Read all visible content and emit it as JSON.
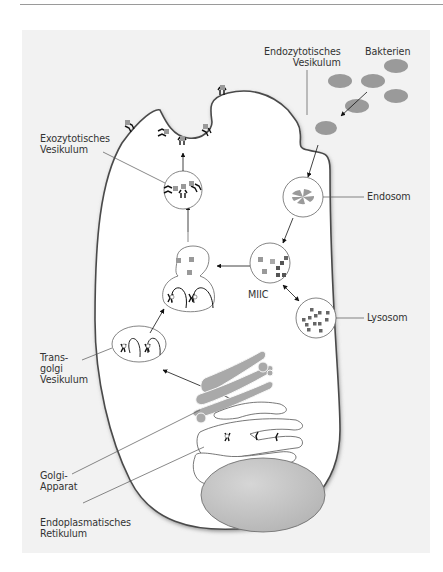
{
  "figure": {
    "type": "cell-diagram",
    "language": "de",
    "colors": {
      "panel_background": "#f2f2f2",
      "cell_interior": "#ffffff",
      "membrane_edge": "#555555",
      "organelle_gray": "#a9a9a9",
      "nucleus_gray": "#c4c4c4",
      "label_text": "#333333"
    }
  },
  "labels": {
    "endocytic_vesicle": {
      "line1": "Endozytotisches",
      "line2": "Vesikulum"
    },
    "bacteria": {
      "line1": "Bakterien"
    },
    "exocytic_vesicle": {
      "line1": "Exozytotisches",
      "line2": "Vesikulum"
    },
    "endosome": {
      "line1": "Endosom"
    },
    "miic": {
      "line1": "MIIC"
    },
    "lysosome": {
      "line1": "Lysosom"
    },
    "trans_golgi_vesicle": {
      "line1": "Trans-",
      "line2": "golgi",
      "line3": "Vesikulum"
    },
    "golgi_apparatus": {
      "line1": "Golgi-",
      "line2": "Apparat"
    },
    "endoplasmic_reticulum": {
      "line1": "Endoplasmatisches",
      "line2": "Retikulum"
    }
  }
}
